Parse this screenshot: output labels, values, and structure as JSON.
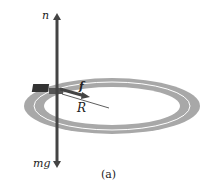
{
  "figure": {
    "caption": "(a)",
    "labels": {
      "normal_force": "n",
      "weight": "mg",
      "friction": "f",
      "radius": "R"
    },
    "colors": {
      "track": "#a8a8a8",
      "lane_line": "#ffffff",
      "force_arrow": "#444444",
      "background": "#ffffff"
    }
  }
}
